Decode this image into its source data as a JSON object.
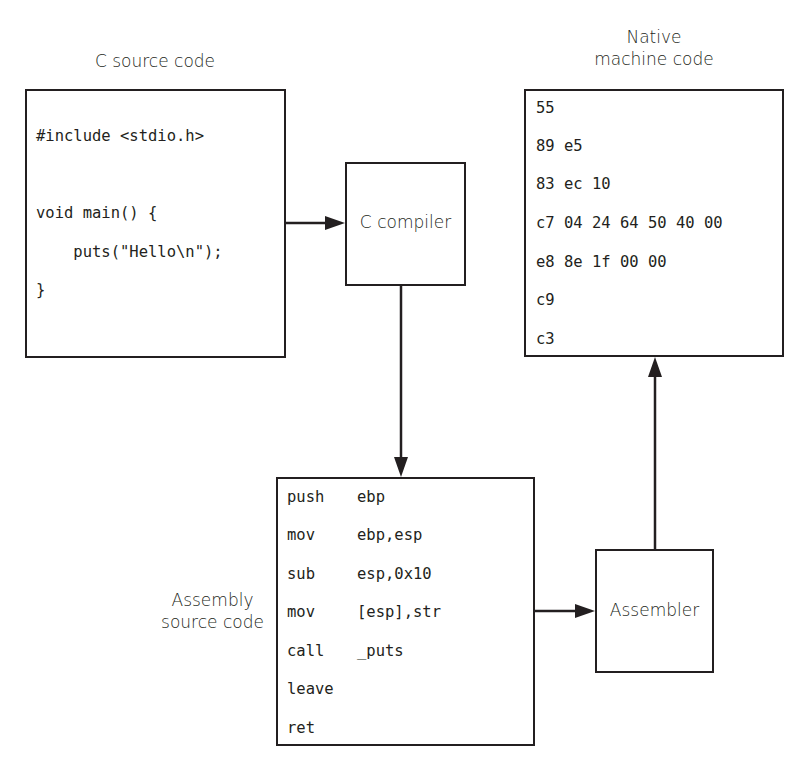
{
  "diagram": {
    "c_source": {
      "title": "C source code",
      "lines": [
        "#include <stdio.h>",
        "",
        "void main() {",
        "    puts(\"Hello\\n\");",
        "}"
      ]
    },
    "compiler": {
      "label": "C compiler"
    },
    "machine_code": {
      "title_line1": "Native",
      "title_line2": "machine code",
      "lines": [
        "55",
        "89 e5",
        "83 ec 10",
        "c7 04 24 64 50 40 00",
        "e8 8e 1f 00 00",
        "c9",
        "c3"
      ]
    },
    "assembly": {
      "title_line1": "Assembly",
      "title_line2": "source code",
      "rows": [
        {
          "op": "push",
          "arg": "ebp"
        },
        {
          "op": "mov",
          "arg": "ebp,esp"
        },
        {
          "op": "sub",
          "arg": "esp,0x10"
        },
        {
          "op": "mov",
          "arg": "[esp],str"
        },
        {
          "op": "call",
          "arg": "_puts"
        },
        {
          "op": "leave",
          "arg": ""
        },
        {
          "op": "ret",
          "arg": ""
        }
      ]
    },
    "assembler": {
      "label": "Assembler"
    },
    "colors": {
      "stroke": "#231f20",
      "background": "#ffffff"
    }
  }
}
